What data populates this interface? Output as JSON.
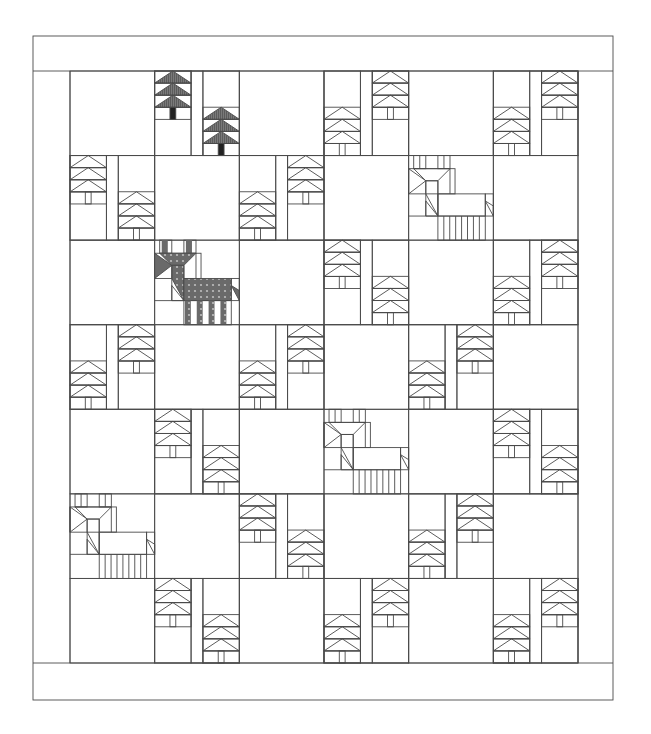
{
  "colors": {
    "line": "#4a4a4a",
    "background": "#ffffff",
    "tree_color": "#7a7a7a",
    "trunk_color": "#222222",
    "deer_color": "#6a6a6a"
  },
  "quilt": {
    "rows": 7,
    "cols": 6,
    "borders": [
      "top-border",
      "bottom-border",
      "left-border",
      "right-border"
    ],
    "block_types": {
      "blank": "Plain square",
      "trees-lh": "Tree pair, left tree high / right tree low",
      "trees-ll": "Tree pair, left tree low / right tree high",
      "deer": "Deer block",
      "deer-color": "Deer block (colored)",
      "trees-lh-color": "Tree pair (colored), left tree high / right tree low"
    },
    "grid": [
      [
        "blank",
        "trees-lh-color",
        "blank",
        "trees-ll",
        "blank",
        "trees-ll"
      ],
      [
        "trees-lh",
        "blank",
        "trees-ll",
        "blank",
        "deer",
        "blank"
      ],
      [
        "blank",
        "deer-color",
        "blank",
        "trees-lh",
        "blank",
        "trees-ll"
      ],
      [
        "trees-ll",
        "blank",
        "trees-ll",
        "blank",
        "trees-ll",
        "blank"
      ],
      [
        "blank",
        "trees-lh",
        "blank",
        "deer",
        "blank",
        "trees-lh"
      ],
      [
        "deer",
        "blank",
        "trees-lh",
        "blank",
        "trees-ll",
        "blank"
      ],
      [
        "blank",
        "trees-lh",
        "blank",
        "trees-ll",
        "blank",
        "trees-ll"
      ]
    ]
  }
}
